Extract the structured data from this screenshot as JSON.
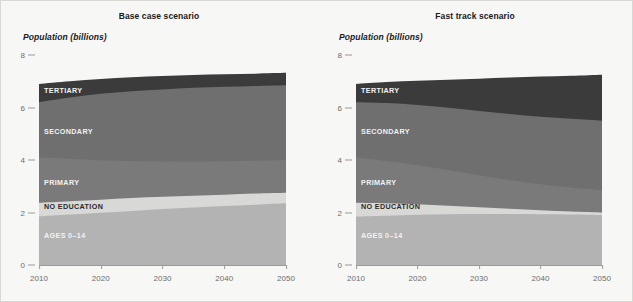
{
  "figure": {
    "background": "#f7f7f5",
    "border_color": "#d9d8d4"
  },
  "panels": [
    {
      "id": "base-case",
      "title": "Base case scenario",
      "axis_title": "Population (billions)"
    },
    {
      "id": "fast-track",
      "title": "Fast track scenario",
      "axis_title": "Population (billions)"
    }
  ],
  "axes": {
    "y_ticks": [
      "0",
      "2",
      "4",
      "6",
      "8"
    ],
    "x_ticks": [
      "2010",
      "2020",
      "2030",
      "2040",
      "2050"
    ],
    "ylim": [
      0,
      8
    ],
    "xlim": [
      2010,
      2050
    ],
    "grid": false
  },
  "legend_labels": {
    "ages": "AGES 0–14",
    "no_education": "NO EDUCATION",
    "primary": "PRIMARY",
    "secondary": "SECONDARY",
    "tertiary": "TERTIARY"
  },
  "colors": {
    "ages": "#b3b3b3",
    "no_education": "#d8d8d6",
    "primary": "#7a7a7a",
    "secondary": "#6f6f6f",
    "tertiary": "#3b3b3b",
    "axis": "#9a9a9a",
    "tick_text": "#6d6d6d",
    "title_text": "#1a1a1a",
    "label_light": "#f2f2f2"
  },
  "chart_data": [
    {
      "type": "area",
      "title": "Base case scenario",
      "xlabel": "",
      "ylabel": "Population (billions)",
      "ylim": [
        0,
        8
      ],
      "xlim": [
        2010,
        2050
      ],
      "grid": false,
      "legend_position": "inline-labels",
      "stacked": true,
      "x": [
        2010,
        2015,
        2020,
        2025,
        2030,
        2035,
        2040,
        2045,
        2050
      ],
      "series": [
        {
          "name": "AGES 0–14",
          "values": [
            1.85,
            1.92,
            1.99,
            2.06,
            2.13,
            2.19,
            2.25,
            2.3,
            2.35
          ]
        },
        {
          "name": "NO EDUCATION",
          "values": [
            0.52,
            0.51,
            0.5,
            0.49,
            0.47,
            0.45,
            0.43,
            0.42,
            0.4
          ]
        },
        {
          "name": "PRIMARY",
          "values": [
            1.73,
            1.62,
            1.5,
            1.41,
            1.34,
            1.3,
            1.27,
            1.25,
            1.25
          ]
        },
        {
          "name": "SECONDARY",
          "values": [
            2.1,
            2.33,
            2.53,
            2.66,
            2.75,
            2.81,
            2.84,
            2.85,
            2.85
          ]
        },
        {
          "name": "TERTIARY",
          "values": [
            0.7,
            0.74,
            0.78,
            0.8,
            0.82,
            0.83,
            0.84,
            0.44,
            0.45
          ]
        }
      ],
      "tops": {
        "ages": [
          1.85,
          1.92,
          1.99,
          2.06,
          2.13,
          2.19,
          2.25,
          2.3,
          2.35
        ],
        "no_education": [
          2.37,
          2.43,
          2.49,
          2.55,
          2.6,
          2.64,
          2.68,
          2.72,
          2.75
        ],
        "primary": [
          4.1,
          4.05,
          3.99,
          3.96,
          3.94,
          3.94,
          3.95,
          3.97,
          4.0
        ],
        "secondary": [
          6.2,
          6.38,
          6.52,
          6.62,
          6.69,
          6.75,
          6.79,
          6.82,
          6.85
        ],
        "tertiary": [
          6.9,
          7.0,
          7.09,
          7.15,
          7.2,
          7.24,
          7.27,
          7.29,
          7.32
        ]
      }
    },
    {
      "type": "area",
      "title": "Fast track scenario",
      "xlabel": "",
      "ylabel": "Population (billions)",
      "ylim": [
        0,
        8
      ],
      "xlim": [
        2010,
        2050
      ],
      "grid": false,
      "legend_position": "inline-labels",
      "stacked": true,
      "x": [
        2010,
        2015,
        2020,
        2025,
        2030,
        2035,
        2040,
        2045,
        2050
      ],
      "tops": {
        "ages": [
          1.85,
          1.88,
          1.91,
          1.93,
          1.94,
          1.94,
          1.93,
          1.92,
          1.9
        ],
        "no_education": [
          2.37,
          2.35,
          2.31,
          2.26,
          2.2,
          2.14,
          2.09,
          2.04,
          2.0
        ],
        "primary": [
          4.1,
          3.96,
          3.8,
          3.62,
          3.42,
          3.24,
          3.08,
          2.95,
          2.85
        ],
        "secondary": [
          6.2,
          6.17,
          6.1,
          5.99,
          5.87,
          5.75,
          5.65,
          5.57,
          5.5
        ],
        "tertiary": [
          6.9,
          6.97,
          7.02,
          7.06,
          7.1,
          7.14,
          7.18,
          7.21,
          7.25
        ]
      }
    }
  ]
}
